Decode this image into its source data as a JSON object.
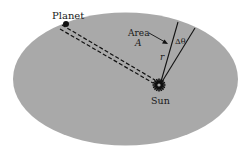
{
  "figure": {
    "colors": {
      "background": "#ffffff",
      "orbit_fill": "#a9a9a9",
      "ink": "#111111"
    },
    "labels": {
      "planet": "Planet",
      "sun": "Sun",
      "area_word": "Area",
      "area_symbol": "A",
      "radius_symbol": "r",
      "angle_symbol": "Δθ"
    }
  }
}
